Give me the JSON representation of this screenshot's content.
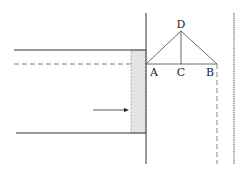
{
  "diagram": {
    "labels": {
      "D": "D",
      "A": "A",
      "C": "C",
      "B": "B"
    },
    "colors": {
      "line": "#333333",
      "dashed": "#666666",
      "fill": "#e4e4e4"
    }
  }
}
